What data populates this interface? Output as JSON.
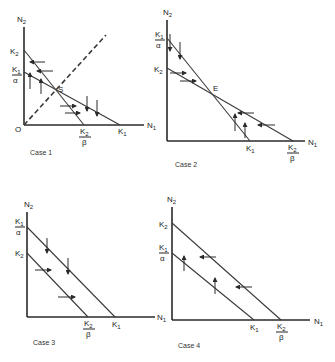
{
  "panels": [
    {
      "id": "case1",
      "caption": "Case 1",
      "y_axis": "N2",
      "x_axis": "N1",
      "y_ticks": [
        "K2",
        "K1/α"
      ],
      "x_ticks": [
        "K2/β",
        "K1"
      ],
      "point": "S",
      "origin": "O"
    },
    {
      "id": "case2",
      "caption": "Case 2",
      "y_axis": "N2",
      "x_axis": "N1",
      "y_ticks": [
        "K1/α",
        "K2"
      ],
      "x_ticks": [
        "K1",
        "K2/β"
      ],
      "point": "E"
    },
    {
      "id": "case3",
      "caption": "Case 3",
      "y_axis": "N2",
      "x_axis": "N1",
      "y_ticks": [
        "K1/α",
        "K2"
      ],
      "x_ticks": [
        "K2/β",
        "K1"
      ]
    },
    {
      "id": "case4",
      "caption": "Case 4",
      "y_axis": "N2",
      "x_axis": "N1",
      "y_ticks": [
        "K2",
        "K1/α"
      ],
      "x_ticks": [
        "K1",
        "K2/β"
      ]
    }
  ],
  "labels": {
    "n2": "N",
    "n2sub": "2",
    "n1": "N",
    "n1sub": "1",
    "k": "K",
    "sub1": "1",
    "sub2": "2",
    "alpha": "α",
    "beta": "β",
    "S": "S",
    "E": "E",
    "O": "O",
    "case1": "Case 1",
    "case2": "Case 2",
    "case3": "Case 3",
    "case4": "Case 4"
  }
}
